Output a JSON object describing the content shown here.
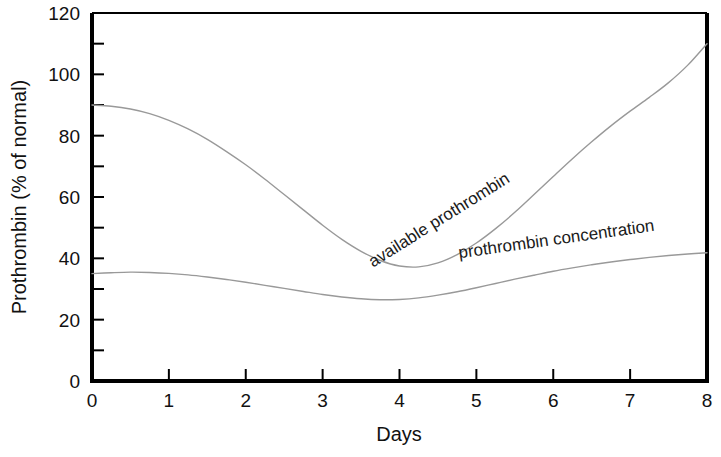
{
  "chart_data": {
    "type": "line",
    "title": "",
    "xlabel": "Days",
    "ylabel": "Prothrombin (% of normal)",
    "xlim": [
      0,
      8
    ],
    "ylim": [
      0,
      120
    ],
    "xticks": [
      "0",
      "1",
      "2",
      "3",
      "4",
      "5",
      "6",
      "7",
      "8"
    ],
    "yticks": [
      "0",
      "20",
      "40",
      "60",
      "80",
      "100",
      "120"
    ],
    "y_minor_tick_step": 10,
    "grid": false,
    "legend_position": "inline-curve-labels",
    "line_color": "#999999",
    "axis_color": "#000000",
    "series": [
      {
        "name": "available prothrombin",
        "label": "available prothrombin",
        "x": [
          0,
          0.25,
          0.5,
          0.75,
          1,
          1.25,
          1.5,
          1.75,
          2,
          2.25,
          2.5,
          2.75,
          3,
          3.25,
          3.5,
          3.75,
          4,
          4.25,
          4.5,
          4.75,
          5,
          5.25,
          5.5,
          5.75,
          6,
          6.25,
          6.5,
          6.75,
          7,
          7.25,
          7.5,
          7.75,
          8
        ],
        "values": [
          90,
          89.6,
          88.7,
          87.2,
          85,
          82.2,
          78.8,
          74.8,
          70.5,
          65.8,
          60.8,
          55.8,
          50.8,
          46.2,
          42.3,
          39.3,
          37.5,
          37.2,
          38.5,
          41.2,
          45,
          49.7,
          55,
          60.8,
          66.7,
          72.5,
          78,
          83.2,
          88,
          92.5,
          97.3,
          103,
          110
        ]
      },
      {
        "name": "prothrombin concentration",
        "label": "prothrombin concentration",
        "x": [
          0,
          0.25,
          0.5,
          0.75,
          1,
          1.25,
          1.5,
          1.75,
          2,
          2.25,
          2.5,
          2.75,
          3,
          3.25,
          3.5,
          3.75,
          4,
          4.25,
          4.5,
          4.75,
          5,
          5.25,
          5.5,
          5.75,
          6,
          6.25,
          6.5,
          6.75,
          7,
          7.25,
          7.5,
          7.75,
          8
        ],
        "values": [
          35,
          35.3,
          35.5,
          35.4,
          35.1,
          34.6,
          33.9,
          33.1,
          32.2,
          31.2,
          30.2,
          29.2,
          28.2,
          27.4,
          26.8,
          26.5,
          26.6,
          27.1,
          28,
          29.1,
          30.4,
          31.8,
          33.2,
          34.5,
          35.8,
          36.9,
          37.9,
          38.8,
          39.6,
          40.3,
          40.9,
          41.4,
          41.8
        ]
      }
    ],
    "annotations": [
      {
        "text": "available prothrombin",
        "x_data": 4.55,
        "y_data": 51,
        "rotation": -32
      },
      {
        "text": "prothrombin concentration",
        "x_data": 6.05,
        "y_data": 44.5,
        "rotation": -8
      }
    ]
  }
}
